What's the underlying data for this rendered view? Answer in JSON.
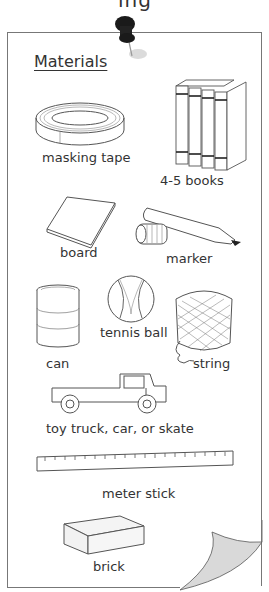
{
  "header": {
    "cut_off_text": "ing"
  },
  "worksheet": {
    "title": "Materials",
    "items": [
      {
        "id": "masking-tape",
        "label": "masking tape"
      },
      {
        "id": "books",
        "label": "4-5 books"
      },
      {
        "id": "board",
        "label": "board"
      },
      {
        "id": "marker",
        "label": "marker"
      },
      {
        "id": "can",
        "label": "can"
      },
      {
        "id": "tennis-ball",
        "label": "tennis ball"
      },
      {
        "id": "string",
        "label": "string"
      },
      {
        "id": "toy-truck",
        "label": "toy truck, car, or skate"
      },
      {
        "id": "meter-stick",
        "label": "meter stick"
      },
      {
        "id": "brick",
        "label": "brick"
      }
    ]
  },
  "colors": {
    "line": "#555555",
    "pin": "#1a1a1a",
    "curl": "#d9d9d9",
    "border": "#777777"
  }
}
